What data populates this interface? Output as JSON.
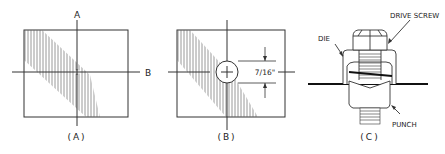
{
  "figure": {
    "panels": [
      {
        "id": "A",
        "caption": "(A)",
        "axis_labels": {
          "vertical": "A",
          "horizontal": "B"
        }
      },
      {
        "id": "B",
        "caption": "(B)",
        "dimension": "7/16\""
      },
      {
        "id": "C",
        "caption": "(C)",
        "callouts": {
          "die": "DIE",
          "drive_screw": "DRIVE SCREW",
          "punch": "PUNCH"
        }
      }
    ]
  }
}
